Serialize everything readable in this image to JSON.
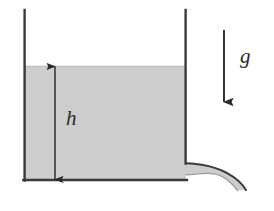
{
  "figure": {
    "kind": "physics-diagram",
    "background_color": "#ffffff"
  },
  "labels": {
    "height_symbol": "h",
    "gravity_symbol": "g"
  },
  "colors": {
    "outline": "#3a3a3a",
    "liquid_fill": "#cdcdcd",
    "liquid_edge": "#b4b4b4",
    "arrow": "#2b2b2b",
    "text": "#2b2b2b"
  },
  "geometry": {
    "tank": {
      "left_wall_x": 24,
      "right_wall_x": 186,
      "wall_top_y": 10,
      "floor_y": 180,
      "right_wall_bottom_y": 163,
      "wall_stroke_width": 2.4
    },
    "liquid": {
      "surface_y": 66,
      "fill_left_x": 24,
      "fill_right_x": 186
    },
    "height_dimension": {
      "x": 55,
      "top_y": 66,
      "bottom_y": 180,
      "arrowheads": "both"
    },
    "gravity_arrow": {
      "x": 224,
      "top_y": 30,
      "bottom_y": 103,
      "arrowheads": "bottom"
    },
    "jet": {
      "origin_x": 186,
      "origin_y": 163,
      "end_x": 246,
      "end_y": 190
    }
  }
}
